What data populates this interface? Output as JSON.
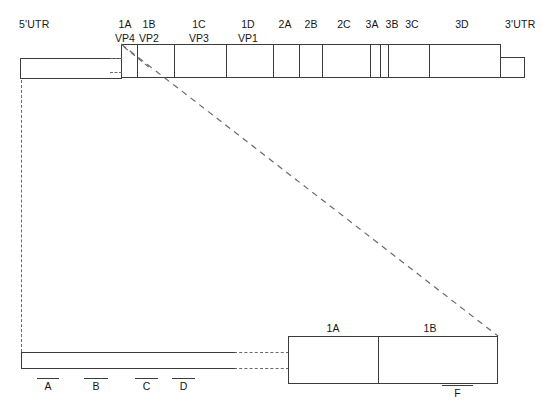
{
  "figure": {
    "top_row": {
      "utr5_label": "5'UTR",
      "utr3_label": "3'UTR",
      "segments": [
        {
          "id": "1A",
          "protein": "VP4"
        },
        {
          "id": "1B",
          "protein": "VP2"
        },
        {
          "id": "1C",
          "protein": "VP3"
        },
        {
          "id": "1D",
          "protein": "VP1"
        },
        {
          "id": "2A",
          "protein": ""
        },
        {
          "id": "2B",
          "protein": ""
        },
        {
          "id": "2C",
          "protein": ""
        },
        {
          "id": "3A",
          "protein": ""
        },
        {
          "id": "3B",
          "protein": ""
        },
        {
          "id": "3C",
          "protein": ""
        },
        {
          "id": "3D",
          "protein": ""
        }
      ]
    },
    "bottom_row": {
      "segments": [
        {
          "id": "1A"
        },
        {
          "id": "1B"
        }
      ],
      "probes_left": [
        "A",
        "B",
        "C",
        "D"
      ],
      "probes_right": [
        "F"
      ]
    }
  },
  "colors": {
    "stroke": "#3b3b3b",
    "dashed": "#6a6a6a",
    "text": "#161616",
    "background": "#ffffff"
  }
}
